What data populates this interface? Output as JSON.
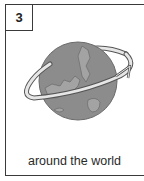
{
  "card": {
    "number": "3",
    "caption": "around the world",
    "illustration": "globe-with-orbit-arrow-icon"
  },
  "colors": {
    "border": "#3a3a3a",
    "globe": "#8c8c8c",
    "land": "#a3a3a3",
    "arrow_fill": "#e6e6e6",
    "text": "#2a2a2a"
  }
}
